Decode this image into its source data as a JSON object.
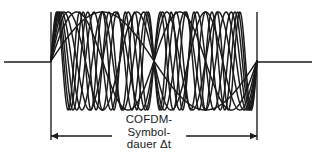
{
  "figure": {
    "background_color": "#ffffff",
    "stroke_color": "#1a1a1a",
    "annotation": {
      "line1": "COFDM-",
      "line2": "Symbol-",
      "line3": "dauer Δt",
      "full_text": "COFDM-Symboldauer Δt",
      "language": "de"
    },
    "dimension": {
      "left_arrow_x": 51,
      "right_arrow_x": 257,
      "line_y": 136,
      "left_segment_end_x": 112,
      "right_segment_start_x": 186,
      "arrow_head_length": 7,
      "arrow_head_half_width": 3.2
    },
    "boundaries": {
      "left_x": 51,
      "right_x": 257,
      "top_y": 12,
      "bottom_y": 140
    },
    "baseline": {
      "y": 62,
      "left_start_x": 4,
      "left_end_x": 51,
      "right_start_x": 257,
      "right_end_x": 312
    }
  },
  "chart_data": {
    "type": "line",
    "xlabel": "",
    "ylabel": "",
    "grid": false,
    "legend": false,
    "x_domain": [
      51,
      257
    ],
    "y_center": 61,
    "amplitude_px": 49,
    "ylim": [
      12,
      110
    ],
    "series": [
      {
        "name": "subcarrier-1",
        "cycles": 2.0,
        "phase_deg": 0,
        "amplitude": 49,
        "color": "#1a1a1a"
      },
      {
        "name": "subcarrier-2",
        "cycles": 3.0,
        "phase_deg": 0,
        "amplitude": 49,
        "color": "#1a1a1a"
      },
      {
        "name": "subcarrier-3",
        "cycles": 4.0,
        "phase_deg": 0,
        "amplitude": 49,
        "color": "#1a1a1a"
      },
      {
        "name": "subcarrier-4",
        "cycles": 5.0,
        "phase_deg": 0,
        "amplitude": 49,
        "color": "#1a1a1a"
      },
      {
        "name": "subcarrier-5",
        "cycles": 6.0,
        "phase_deg": 0,
        "amplitude": 49,
        "color": "#1a1a1a"
      },
      {
        "name": "subcarrier-6",
        "cycles": 7.0,
        "phase_deg": 0,
        "amplitude": 49,
        "color": "#1a1a1a"
      },
      {
        "name": "subcarrier-7",
        "cycles": 8.0,
        "phase_deg": 0,
        "amplitude": 49,
        "color": "#1a1a1a"
      },
      {
        "name": "subcarrier-8",
        "cycles": 9.0,
        "phase_deg": 0,
        "amplitude": 49,
        "color": "#1a1a1a"
      },
      {
        "name": "subcarrier-9",
        "cycles": 1.0,
        "phase_deg": 0,
        "amplitude": 49,
        "color": "#1a1a1a"
      }
    ],
    "annotations": [
      {
        "text": "COFDM-Symboldauer Δt",
        "type": "dimension",
        "from_x": 51,
        "to_x": 257,
        "y": 136
      }
    ]
  }
}
